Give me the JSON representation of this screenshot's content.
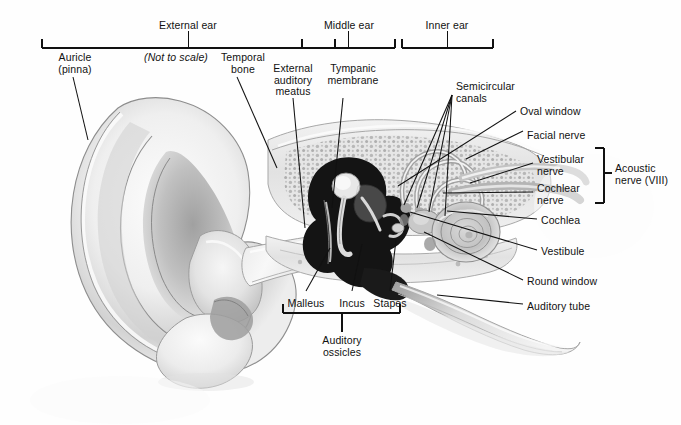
{
  "figure": {
    "note": "(Not to scale)",
    "background_color": "#fefefe",
    "ink_color": "#111111"
  },
  "region_brackets": [
    {
      "name": "external-ear",
      "label": "External ear",
      "x1": 42,
      "x2": 335,
      "label_x": 188,
      "label_y": 20,
      "bar_y": 48,
      "stem_top": 31
    },
    {
      "name": "middle-ear",
      "label": "Middle ear",
      "x1": 302,
      "x2": 395,
      "label_x": 349,
      "label_y": 20,
      "bar_y": 48,
      "stem_top": 31
    },
    {
      "name": "inner-ear",
      "label": "Inner ear",
      "x1": 402,
      "x2": 493,
      "label_x": 447,
      "label_y": 20,
      "bar_y": 48,
      "stem_top": 31
    }
  ],
  "top_labels": [
    {
      "name": "auricle",
      "lines": [
        "Auricle",
        "(pinna)"
      ],
      "x": 75,
      "y": 52,
      "align": "center"
    },
    {
      "name": "not-to-scale",
      "lines": [
        "(Not to scale)"
      ],
      "x": 176,
      "y": 52,
      "align": "center",
      "italic": true
    },
    {
      "name": "temporal-bone",
      "lines": [
        "Temporal",
        "bone"
      ],
      "x": 243,
      "y": 52,
      "align": "center"
    },
    {
      "name": "external-auditory-meatus",
      "lines": [
        "External",
        "auditory",
        "meatus"
      ],
      "x": 293,
      "y": 63,
      "align": "center"
    },
    {
      "name": "tympanic-membrane",
      "lines": [
        "Tympanic",
        "membrane"
      ],
      "x": 353,
      "y": 63,
      "align": "center"
    }
  ],
  "right_labels": [
    {
      "name": "semicircular-canals",
      "lines": [
        "Semicircular",
        "canals"
      ],
      "x": 456,
      "y": 81
    },
    {
      "name": "oval-window",
      "lines": [
        "Oval window"
      ],
      "x": 520,
      "y": 106
    },
    {
      "name": "facial-nerve",
      "lines": [
        "Facial nerve"
      ],
      "x": 527,
      "y": 130
    },
    {
      "name": "vestibular-nerve",
      "lines": [
        "Vestibular",
        "nerve"
      ],
      "x": 537,
      "y": 154
    },
    {
      "name": "cochlear-nerve",
      "lines": [
        "Cochlear",
        "nerve"
      ],
      "x": 537,
      "y": 183
    },
    {
      "name": "cochlea",
      "lines": [
        "Cochlea"
      ],
      "x": 541,
      "y": 215
    },
    {
      "name": "vestibule",
      "lines": [
        "Vestibule"
      ],
      "x": 541,
      "y": 246
    },
    {
      "name": "round-window",
      "lines": [
        "Round window"
      ],
      "x": 527,
      "y": 276
    },
    {
      "name": "auditory-tube",
      "lines": [
        "Auditory tube"
      ],
      "x": 527,
      "y": 301
    }
  ],
  "acoustic_nerve_bracket": {
    "name": "acoustic-nerve",
    "lines": [
      "Acoustic",
      "nerve (VIII)"
    ],
    "label_x": 615,
    "label_y": 163,
    "x": 604,
    "y1": 148,
    "y2": 203,
    "stem_x2": 612,
    "stem_y": 173
  },
  "ossicle_labels": [
    {
      "name": "malleus",
      "label": "Malleus",
      "x": 306,
      "y": 298
    },
    {
      "name": "incus",
      "label": "Incus",
      "x": 352,
      "y": 298
    },
    {
      "name": "stapes",
      "label": "Stapes",
      "x": 390,
      "y": 298
    }
  ],
  "ossicles_bracket": {
    "name": "auditory-ossicles",
    "lines": [
      "Auditory",
      "ossicles"
    ],
    "x1": 283,
    "x2": 400,
    "bar_y": 313,
    "stem_x": 342,
    "stem_y2": 332,
    "label_x": 342,
    "label_y": 335
  },
  "leader_lines": [
    {
      "name": "leader-auricle",
      "x1": 73,
      "y1": 77,
      "x2": 88,
      "y2": 140
    },
    {
      "name": "leader-temporal-bone",
      "x1": 237,
      "y1": 77,
      "x2": 277,
      "y2": 168
    },
    {
      "name": "leader-ext-meatus",
      "x1": 293,
      "y1": 98,
      "x2": 305,
      "y2": 228
    },
    {
      "name": "leader-tympanic-memb",
      "x1": 343,
      "y1": 98,
      "x2": 332,
      "y2": 208
    },
    {
      "name": "leader-semicircular-1",
      "x1": 452,
      "y1": 95,
      "x2": 404,
      "y2": 205
    },
    {
      "name": "leader-semicircular-2",
      "x1": 452,
      "y1": 95,
      "x2": 417,
      "y2": 208
    },
    {
      "name": "leader-semicircular-3",
      "x1": 452,
      "y1": 95,
      "x2": 429,
      "y2": 212
    },
    {
      "name": "leader-semicircular-4",
      "x1": 452,
      "y1": 95,
      "x2": 445,
      "y2": 216
    },
    {
      "name": "leader-oval-window",
      "x1": 516,
      "y1": 111,
      "x2": 398,
      "y2": 186
    },
    {
      "name": "leader-facial-nerve",
      "x1": 523,
      "y1": 131,
      "x2": 466,
      "y2": 159
    },
    {
      "name": "leader-vestibular",
      "x1": 533,
      "y1": 163,
      "x2": 470,
      "y2": 183
    },
    {
      "name": "leader-cochlear",
      "x1": 533,
      "y1": 192,
      "x2": 443,
      "y2": 193
    },
    {
      "name": "leader-cochlea",
      "x1": 537,
      "y1": 219,
      "x2": 447,
      "y2": 211
    },
    {
      "name": "leader-vestibule",
      "x1": 537,
      "y1": 250,
      "x2": 410,
      "y2": 212
    },
    {
      "name": "leader-round-window",
      "x1": 523,
      "y1": 280,
      "x2": 424,
      "y2": 232
    },
    {
      "name": "leader-auditory-tube",
      "x1": 523,
      "y1": 304,
      "x2": 437,
      "y2": 295
    },
    {
      "name": "leader-malleus",
      "x1": 306,
      "y1": 291,
      "x2": 330,
      "y2": 248
    },
    {
      "name": "leader-incus",
      "x1": 352,
      "y1": 291,
      "x2": 362,
      "y2": 244
    },
    {
      "name": "leader-stapes",
      "x1": 390,
      "y1": 291,
      "x2": 396,
      "y2": 240
    }
  ]
}
